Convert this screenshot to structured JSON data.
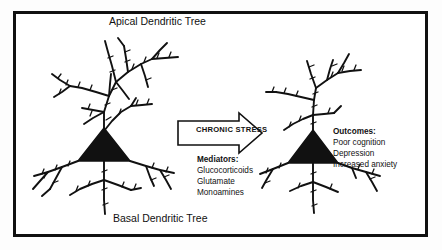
{
  "figure": {
    "title_apical": "Apical Dendritic Tree",
    "title_basal": "Basal Dendritic Tree",
    "frame_color": "#111111",
    "background_color": "#ffffff",
    "ink_color": "#111111"
  },
  "arrow": {
    "label": "CHRONIC STRESS",
    "direction": "right",
    "style": "hollow-outline"
  },
  "mediators": {
    "heading": "Mediators:",
    "items": [
      "Glucocorticoids",
      "Glutamate",
      "Monoamines"
    ]
  },
  "outcomes": {
    "heading": "Outcomes:",
    "items": [
      "Poor cognition",
      "Depression",
      "Increased anxiety"
    ]
  },
  "neurons": {
    "left": {
      "name": "control-neuron",
      "soma_shape": "triangle",
      "state": "intact dendritic arbor"
    },
    "right": {
      "name": "stressed-neuron",
      "soma_shape": "triangle",
      "state": "atrophied dendritic arbor"
    }
  }
}
